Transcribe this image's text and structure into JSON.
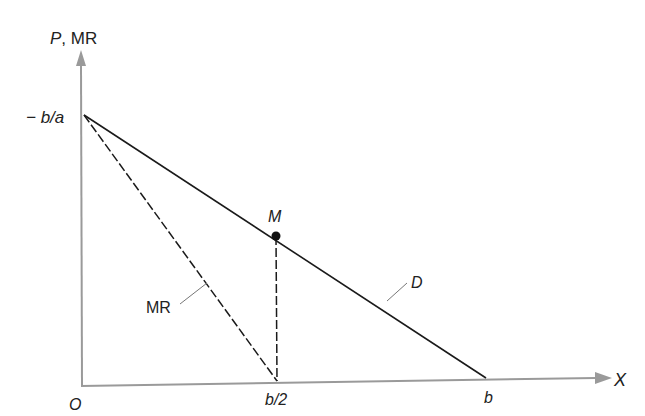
{
  "diagram": {
    "y_axis_label_p": "P",
    "y_axis_label_sep": ", ",
    "y_axis_label_mr": "MR",
    "x_axis_label": "X",
    "origin_label": "O",
    "intercept_label": "− b/a",
    "midpoint_label": "b/2",
    "x_intercept_label": "b",
    "point_label": "M",
    "demand_label": "D",
    "mr_label": "MR",
    "colors": {
      "axis": "#9a9a9a",
      "line": "#1a1a1a",
      "text": "#222222"
    }
  }
}
